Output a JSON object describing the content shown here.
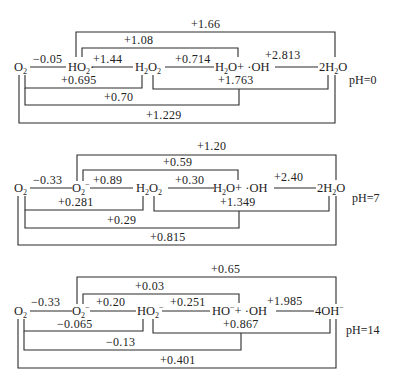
{
  "diagrams": [
    {
      "ph_label": "pH=0",
      "species": {
        "o2": "O2",
        "superoxide": "HO2·",
        "peroxide": "H2O2",
        "radical_pair": "H2O+ ·OH",
        "product": "2H2O"
      },
      "potentials": {
        "o2_to_superoxide": "−0.05",
        "superoxide_to_peroxide": "+1.44",
        "peroxide_to_radical": "+0.714",
        "radical_to_product": "+2.813",
        "o2_to_peroxide": "+0.695",
        "superoxide_to_radical": "+1.08",
        "superoxide_to_product": "+1.66",
        "peroxide_to_product": "+1.763",
        "o2_to_radical": "+0.70",
        "o2_to_product": "+1.229"
      }
    },
    {
      "ph_label": "pH=7",
      "species": {
        "o2": "O2",
        "superoxide": "O2−",
        "peroxide": "H2O2",
        "radical_pair": "H2O+ ·OH",
        "product": "2H2O"
      },
      "potentials": {
        "o2_to_superoxide": "−0.33",
        "superoxide_to_peroxide": "+0.89",
        "peroxide_to_radical": "+0.30",
        "radical_to_product": "+2.40",
        "o2_to_peroxide": "+0.281",
        "superoxide_to_radical": "+0.59",
        "superoxide_to_product": "+1.20",
        "peroxide_to_product": "+1.349",
        "o2_to_radical": "+0.29",
        "o2_to_product": "+0.815"
      }
    },
    {
      "ph_label": "pH=14",
      "species": {
        "o2": "O2",
        "superoxide": "O2−",
        "peroxide": "HO2−",
        "radical_pair": "HO−+ ·OH",
        "product": "4OH−"
      },
      "potentials": {
        "o2_to_superoxide": "−0.33",
        "superoxide_to_peroxide": "+0.20",
        "peroxide_to_radical": "+0.251",
        "radical_to_product": "+1.985",
        "o2_to_peroxide": "−0.065",
        "superoxide_to_radical": "+0.03",
        "superoxide_to_product": "+0.65",
        "peroxide_to_product": "+0.867",
        "o2_to_radical": "−0.13",
        "o2_to_product": "+0.401"
      }
    }
  ]
}
